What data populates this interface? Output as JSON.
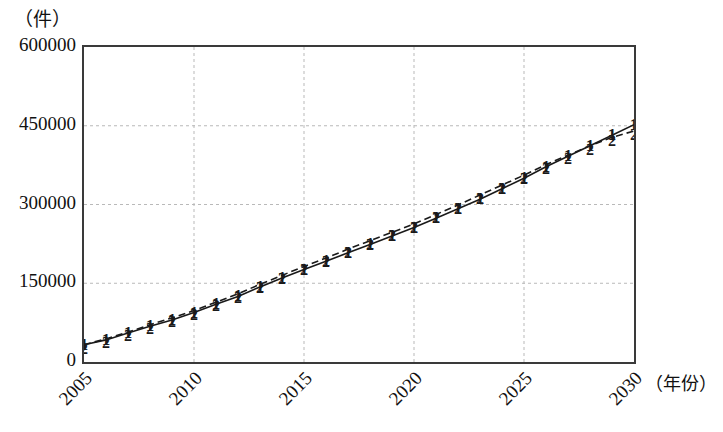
{
  "chart_data": {
    "type": "line",
    "title": "",
    "subtitle": "",
    "xlabel": "（年份）",
    "ylabel": "（件）",
    "x": [
      2005,
      2006,
      2007,
      2008,
      2009,
      2010,
      2011,
      2012,
      2013,
      2014,
      2015,
      2016,
      2017,
      2018,
      2019,
      2020,
      2021,
      2022,
      2023,
      2024,
      2025,
      2026,
      2027,
      2028,
      2029,
      2030
    ],
    "xlim": [
      2005,
      2030
    ],
    "ylim": [
      0,
      600000
    ],
    "xticks": [
      2005,
      2010,
      2015,
      2020,
      2025,
      2030
    ],
    "xticklabels": [
      "2005",
      "2010",
      "2015",
      "2020",
      "2025",
      "2030"
    ],
    "yticks": [
      0,
      150000,
      300000,
      450000,
      600000
    ],
    "yticklabels": [
      "0",
      "150000",
      "300000",
      "450000",
      "600000"
    ],
    "grid": "dashed-light",
    "legend": "none",
    "series": [
      {
        "name": "1",
        "marker": "1",
        "linestyle": "solid",
        "color": "#1a1a1a",
        "values": [
          33000,
          42000,
          55000,
          68000,
          80000,
          94000,
          110000,
          125000,
          143000,
          160000,
          176000,
          192000,
          208000,
          224000,
          240000,
          256000,
          274000,
          292000,
          310000,
          330000,
          350000,
          372000,
          392000,
          412000,
          432000,
          452000
        ]
      },
      {
        "name": "2",
        "marker": "2",
        "linestyle": "dashed",
        "color": "#1a1a1a",
        "values": [
          33000,
          44000,
          57000,
          71000,
          84000,
          98000,
          114000,
          130000,
          148000,
          165000,
          182000,
          198000,
          215000,
          231000,
          247000,
          263000,
          281000,
          299000,
          318000,
          337000,
          356000,
          376000,
          394000,
          412000,
          428000,
          440000
        ]
      }
    ],
    "annotations": []
  },
  "axes": {
    "y_unit": "（件）",
    "x_title": "（年份）"
  }
}
